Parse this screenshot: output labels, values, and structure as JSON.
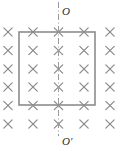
{
  "figure": {
    "name": "magnetic-field-loop-diagram",
    "canvas": {
      "width": 125,
      "height": 154
    },
    "background_color": "#ffffff"
  },
  "axis": {
    "style": "dash-dot",
    "orientation": "vertical",
    "x": 58.5,
    "y_start": 2,
    "y_end": 136,
    "color": "#9a9a9a",
    "stroke_width": 1,
    "label_top": "O",
    "label_bottom": "O'"
  },
  "loop": {
    "shape": "rectangle",
    "x": 19,
    "y": 32,
    "width": 76,
    "height": 73,
    "stroke_color": "#8c8c8c",
    "stroke_width": 1.6,
    "fill": "none"
  },
  "field": {
    "symbol": "x",
    "meaning": "magnetic-field-into-page",
    "color": "#8a8a8a",
    "stroke_width": 1.2,
    "arm": 4.2,
    "columns_x": [
      8,
      33,
      58.5,
      84,
      110
    ],
    "rows_y": [
      32,
      50.5,
      69,
      87,
      105.5
    ],
    "points": [
      {
        "cx": 8,
        "cy": 32
      },
      {
        "cx": 33,
        "cy": 32
      },
      {
        "cx": 58.5,
        "cy": 32
      },
      {
        "cx": 84,
        "cy": 32
      },
      {
        "cx": 110,
        "cy": 32
      },
      {
        "cx": 8,
        "cy": 50.5
      },
      {
        "cx": 33,
        "cy": 50.5
      },
      {
        "cx": 58.5,
        "cy": 50.5
      },
      {
        "cx": 84,
        "cy": 50.5
      },
      {
        "cx": 110,
        "cy": 50.5
      },
      {
        "cx": 8,
        "cy": 69
      },
      {
        "cx": 33,
        "cy": 69
      },
      {
        "cx": 58.5,
        "cy": 69
      },
      {
        "cx": 84,
        "cy": 69
      },
      {
        "cx": 110,
        "cy": 69
      },
      {
        "cx": 8,
        "cy": 87
      },
      {
        "cx": 33,
        "cy": 87
      },
      {
        "cx": 58.5,
        "cy": 87
      },
      {
        "cx": 84,
        "cy": 87
      },
      {
        "cx": 110,
        "cy": 87
      },
      {
        "cx": 8,
        "cy": 105.5
      },
      {
        "cx": 33,
        "cy": 105.5
      },
      {
        "cx": 58.5,
        "cy": 105.5
      },
      {
        "cx": 84,
        "cy": 105.5
      },
      {
        "cx": 110,
        "cy": 105.5
      },
      {
        "cx": 8,
        "cy": 124
      },
      {
        "cx": 33,
        "cy": 124
      },
      {
        "cx": 58.5,
        "cy": 124
      },
      {
        "cx": 84,
        "cy": 124
      },
      {
        "cx": 110,
        "cy": 124
      }
    ]
  }
}
